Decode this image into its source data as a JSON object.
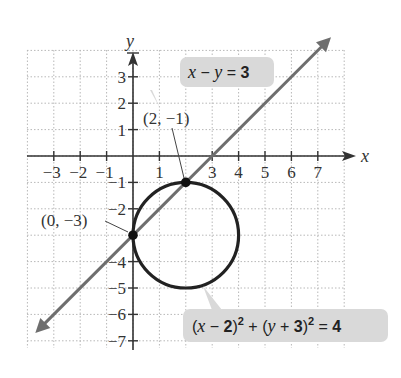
{
  "figure": {
    "axes": {
      "x_label": "x",
      "y_label": "y",
      "x_ticks": [
        -3,
        -2,
        -1,
        1,
        3,
        4,
        5,
        6,
        7
      ],
      "y_ticks": [
        3,
        2,
        1,
        -1,
        -2,
        -4,
        -5,
        -6,
        -7
      ],
      "x_tick_labels": [
        "−3",
        "−2",
        "−1",
        "1",
        "3",
        "4",
        "5",
        "6",
        "7"
      ],
      "y_tick_labels": [
        "3",
        "2",
        "1",
        "−1",
        "−2",
        "−4",
        "−5",
        "−6",
        "−7"
      ],
      "grid": "dotted",
      "x_range": [
        -4,
        8
      ],
      "y_range": [
        -9,
        5
      ]
    },
    "line": {
      "equation_label_prefix": "x − y = ",
      "equation_parts": {
        "x": "x",
        "minus": " − ",
        "y": "y",
        "eq": " = ",
        "rhs": "3"
      },
      "color": "#6e6e6e"
    },
    "circle": {
      "equation_parts": {
        "open1": "(",
        "x": "x",
        "minus2": " − ",
        "h": "2",
        "close1": ")",
        "sq1": "2",
        "plus": " + ",
        "open2": "(",
        "y": "y",
        "plus3": " + ",
        "k": "3",
        "close2": ")",
        "sq2": "2",
        "eq": " = ",
        "rhs": "4"
      },
      "center": [
        2,
        -3
      ],
      "radius": 2,
      "color": "#222222"
    },
    "points": [
      {
        "label": "(2, −1)",
        "x": 2,
        "y": -1
      },
      {
        "label": "(0, −3)",
        "x": 0,
        "y": -3
      }
    ],
    "callout_bg": "#d9d9d9"
  }
}
